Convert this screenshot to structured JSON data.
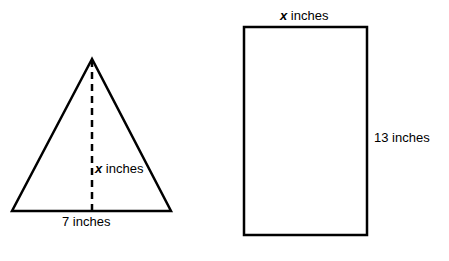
{
  "diagram": {
    "stroke_color": "#000000",
    "background": "#ffffff",
    "triangle": {
      "base_label": "7 inches",
      "height_label": {
        "variable": "x",
        "unit": " inches"
      },
      "apex": [
        92,
        59
      ],
      "base_left": [
        12,
        211
      ],
      "base_right": [
        171,
        211
      ],
      "height_line_style": "dashed"
    },
    "rectangle": {
      "width_label": {
        "variable": "x",
        "unit": " inches"
      },
      "height_label": "13 inches",
      "top_left": [
        244,
        27
      ],
      "bottom_right": [
        367,
        235
      ]
    }
  }
}
